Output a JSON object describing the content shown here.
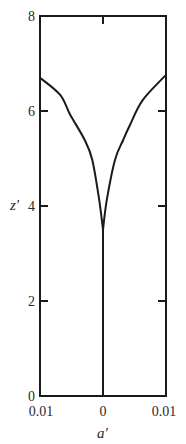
{
  "chart_data": {
    "type": "line",
    "title": "",
    "xlabel": "a′",
    "ylabel": "z′",
    "xlim": [
      -0.01,
      0.01
    ],
    "ylim": [
      0,
      8
    ],
    "x_tick_labels": [
      "0.01",
      "0",
      "0.01"
    ],
    "x_ticks": [
      -0.01,
      0,
      0.01
    ],
    "y_tick_labels": [
      "0",
      "2",
      "4",
      "6",
      "8"
    ],
    "y_ticks": [
      0,
      2,
      4,
      6,
      8
    ],
    "grid": false,
    "legend": null,
    "series": [
      {
        "name": "left-branch",
        "x": [
          -0.01,
          -0.0068,
          -0.0052,
          -0.0029,
          -0.0017,
          -0.0006,
          0.0
        ],
        "y": [
          6.7,
          6.34,
          5.92,
          5.39,
          4.97,
          4.13,
          3.5
        ]
      },
      {
        "name": "right-branch",
        "x": [
          0.01,
          0.0063,
          0.0043,
          0.0032,
          0.0019,
          0.0006,
          0.0
        ],
        "y": [
          6.76,
          6.23,
          5.71,
          5.39,
          4.97,
          4.13,
          3.5
        ]
      },
      {
        "name": "stem",
        "x": [
          0.0,
          0.0
        ],
        "y": [
          0.0,
          3.5
        ]
      }
    ],
    "colors": {
      "line": "#1a1a1a",
      "frame": "#1a1a1a",
      "text": "#2a2a2a"
    }
  }
}
